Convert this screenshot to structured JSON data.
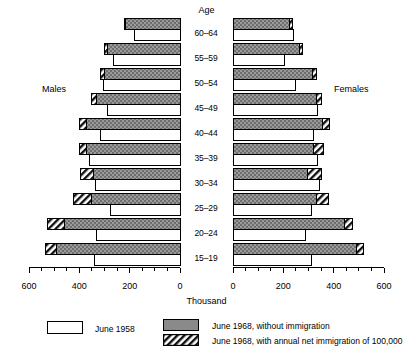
{
  "header": {
    "age_label": "Age"
  },
  "sides": {
    "left": "Males",
    "right": "Females"
  },
  "axis": {
    "unit_label": "Thousand",
    "ticks": [
      "600",
      "400",
      "200",
      "0",
      "0",
      "200",
      "400",
      "600"
    ]
  },
  "legend": {
    "items": [
      {
        "swatch": "white-box",
        "label": "June 1958"
      },
      {
        "swatch": "solid-gray-box",
        "label": "June 1968, without immigration"
      },
      {
        "swatch": "hatched-box",
        "label": "June 1968, with annual net immigration of 100,000"
      }
    ]
  },
  "chart_data": {
    "type": "bar",
    "subtype": "population-pyramid",
    "title": "",
    "xlabel": "Thousand",
    "ylabel": "Age",
    "xlim": [
      0,
      600
    ],
    "tick_interval": 50,
    "label_interval": 200,
    "grid": false,
    "legend_position": "bottom",
    "categories": [
      "60–64",
      "55–59",
      "50–54",
      "45–49",
      "40–44",
      "35–39",
      "30–34",
      "25–29",
      "20–24",
      "15–19"
    ],
    "series": [
      {
        "name": "June 1958",
        "side": "males",
        "values": [
          180,
          265,
          305,
          290,
          315,
          360,
          335,
          275,
          330,
          340
        ]
      },
      {
        "name": "June 1968, without immigration",
        "side": "males",
        "values": [
          215,
          290,
          300,
          330,
          370,
          370,
          345,
          350,
          460,
          490
        ]
      },
      {
        "name": "June 1968, with annual net immigration of 100,000",
        "side": "males",
        "values": [
          220,
          300,
          315,
          350,
          400,
          400,
          395,
          425,
          525,
          535
        ]
      },
      {
        "name": "June 1958",
        "side": "females",
        "values": [
          240,
          205,
          250,
          335,
          320,
          335,
          345,
          310,
          290,
          310
        ]
      },
      {
        "name": "June 1968, without immigration",
        "side": "females",
        "values": [
          225,
          265,
          315,
          330,
          355,
          320,
          295,
          330,
          445,
          490
        ]
      },
      {
        "name": "June 1968, with annual net immigration of 100,000",
        "side": "females",
        "values": [
          235,
          275,
          330,
          350,
          385,
          360,
          350,
          380,
          475,
          520
        ]
      }
    ]
  }
}
